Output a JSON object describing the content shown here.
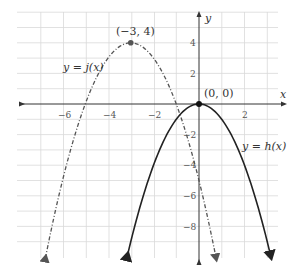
{
  "chart_data": {
    "type": "line",
    "title": "",
    "xlabel": "x",
    "ylabel": "y",
    "xlim": [
      -8,
      3.5
    ],
    "ylim": [
      -9.8,
      6
    ],
    "grid": true,
    "x_ticks": [
      -6,
      -4,
      -2,
      2
    ],
    "y_ticks": [
      4,
      2,
      -2,
      -4,
      -6,
      -8
    ],
    "series": [
      {
        "name": "y = h(x)",
        "formula": "h(x) = -x^2",
        "style": "solid",
        "color": "#222222",
        "vertex": [
          0,
          0
        ],
        "x_range": [
          -3.15,
          3.15
        ]
      },
      {
        "name": "y = j(x)",
        "formula": "j(x) = -(x+3)^2 + 4",
        "style": "dash-dot",
        "color": "#555555",
        "vertex": [
          -3,
          4
        ],
        "x_range": [
          -6.75,
          0.75
        ]
      }
    ],
    "annotations": [
      {
        "text": "(−3, 4)",
        "x": -3,
        "y": 4
      },
      {
        "text": "(0, 0)",
        "x": 0,
        "y": 0
      },
      {
        "text": "y = j(x)",
        "near": "left branch of j"
      },
      {
        "text": "y = h(x)",
        "near": "right branch of h"
      }
    ]
  },
  "labels": {
    "x_axis": "x",
    "y_axis": "y",
    "ticks_x": [
      "−6",
      "−4",
      "−2",
      "2"
    ],
    "ticks_y": [
      "4",
      "2",
      "−2",
      "−4",
      "−6",
      "−8"
    ],
    "vertex_j": "(−3, 4)",
    "vertex_h": "(0, 0)",
    "curve_j": "y = j(x)",
    "curve_h": "y = h(x)"
  }
}
